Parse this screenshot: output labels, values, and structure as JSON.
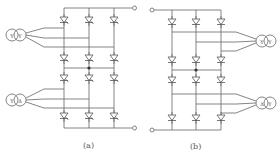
{
  "figure": {
    "panels": [
      {
        "id": "a",
        "caption": "(a)",
        "device": "thyristor",
        "transformers": [
          {
            "primary": "Y",
            "secondary": "Y"
          },
          {
            "primary": "Y",
            "secondary": "Δ"
          }
        ],
        "bridges": 2,
        "columns": 3
      },
      {
        "id": "b",
        "caption": "(b)",
        "device": "diode",
        "transformers": [
          {
            "primary": "Y",
            "secondary": "Y"
          },
          {
            "primary": "Δ",
            "secondary": "Y"
          }
        ],
        "bridges": 2,
        "columns": 3
      }
    ],
    "colors": {
      "line": "#666666",
      "background": "#ffffff"
    }
  }
}
